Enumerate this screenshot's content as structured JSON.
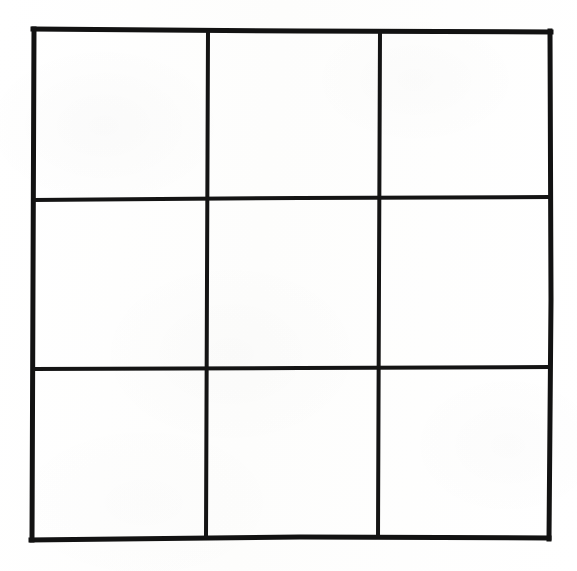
{
  "figure": {
    "kind": "line-drawing",
    "canvas": {
      "width": 577,
      "height": 571
    },
    "background_color": "#fefefe",
    "line_color": "#121212",
    "outer_border_thickness_px": 5,
    "inner_line_thickness_px": 4,
    "rows": 3,
    "columns": 3,
    "frame": {
      "left": 32,
      "top": 28,
      "right": 551,
      "bottom": 539
    },
    "vertical_line_x": [
      208,
      379
    ],
    "horizontal_line_y": [
      198,
      368
    ],
    "cells": [
      {
        "id": "cell-r1c1",
        "row": 1,
        "column": 1,
        "label": "",
        "x": 36,
        "y": 32,
        "width": 170,
        "height": 164
      },
      {
        "id": "cell-r1c2",
        "row": 1,
        "column": 2,
        "label": "",
        "x": 212,
        "y": 31,
        "width": 165,
        "height": 165
      },
      {
        "id": "cell-r1c3",
        "row": 1,
        "column": 3,
        "label": "",
        "x": 383,
        "y": 30,
        "width": 166,
        "height": 166
      },
      {
        "id": "cell-r2c1",
        "row": 2,
        "column": 1,
        "label": "",
        "x": 36,
        "y": 202,
        "width": 170,
        "height": 164
      },
      {
        "id": "cell-r2c2",
        "row": 2,
        "column": 2,
        "label": "",
        "x": 212,
        "y": 201,
        "width": 165,
        "height": 165
      },
      {
        "id": "cell-r2c3",
        "row": 2,
        "column": 3,
        "label": "",
        "x": 383,
        "y": 200,
        "width": 166,
        "height": 166
      },
      {
        "id": "cell-r3c1",
        "row": 3,
        "column": 1,
        "label": "",
        "x": 36,
        "y": 372,
        "width": 170,
        "height": 164
      },
      {
        "id": "cell-r3c2",
        "row": 3,
        "column": 2,
        "label": "",
        "x": 212,
        "y": 371,
        "width": 165,
        "height": 164
      },
      {
        "id": "cell-r3c3",
        "row": 3,
        "column": 3,
        "label": "",
        "x": 383,
        "y": 370,
        "width": 166,
        "height": 164
      }
    ]
  }
}
